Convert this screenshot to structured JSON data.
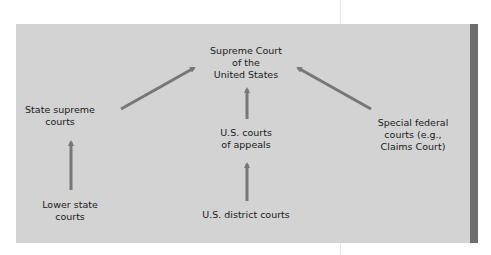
{
  "diagram": {
    "title": "",
    "colors": {
      "panel": "#d3d3d3",
      "stripe": "#6e6e6e",
      "arrow": "#777777",
      "text": "#1a1a1a"
    },
    "nodes": {
      "supreme_court": {
        "line1": "Supreme Court",
        "line2": "of the",
        "line3": "United States"
      },
      "state_supreme": {
        "line1": "State supreme",
        "line2": "courts"
      },
      "courts_of_appeals": {
        "line1": "U.S. courts",
        "line2": "of appeals"
      },
      "special_federal": {
        "line1": "Special federal",
        "line2": "courts (e.g.,",
        "line3": "Claims Court)"
      },
      "lower_state": {
        "line1": "Lower state",
        "line2": "courts"
      },
      "district_courts": {
        "line1": "U.S. district courts"
      }
    },
    "edges": [
      {
        "from": "Lower state courts",
        "to": "State supreme courts"
      },
      {
        "from": "State supreme courts",
        "to": "Supreme Court of the United States"
      },
      {
        "from": "U.S. district courts",
        "to": "U.S. courts of appeals"
      },
      {
        "from": "U.S. courts of appeals",
        "to": "Supreme Court of the United States"
      },
      {
        "from": "Special federal courts (e.g., Claims Court)",
        "to": "Supreme Court of the United States"
      }
    ]
  }
}
